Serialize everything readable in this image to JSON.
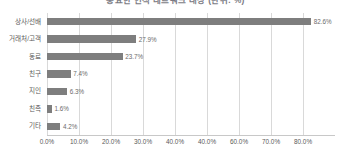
{
  "chart_data": {
    "type": "bar",
    "orientation": "horizontal",
    "title": "중요한 인적 네트워크 대상 (단위: %)",
    "xlabel": "",
    "ylabel": "",
    "categories": [
      "상사/선배",
      "거래처/고객",
      "동료",
      "친구",
      "지인",
      "친족",
      "기타"
    ],
    "values": [
      82.6,
      27.9,
      23.7,
      7.4,
      6.3,
      1.6,
      4.2
    ],
    "value_labels": [
      "82.6%",
      "27.9%",
      "23.7%",
      "7.4%",
      "6.3%",
      "1.6%",
      "4.2%"
    ],
    "xticks": [
      0,
      10,
      20,
      30,
      40,
      40,
      60,
      70,
      80
    ],
    "xtick_labels": [
      "0.0%",
      "10.0%",
      "20.0%",
      "30.0%",
      "40.0%",
      "40.0%",
      "60.0%",
      "70.0%",
      "80.0%"
    ],
    "xlim": [
      0,
      90
    ],
    "grid": true,
    "legend": false,
    "bar_color": "#7e7e7e",
    "grid_color": "#d9d9d9",
    "text_color": "#595959"
  }
}
